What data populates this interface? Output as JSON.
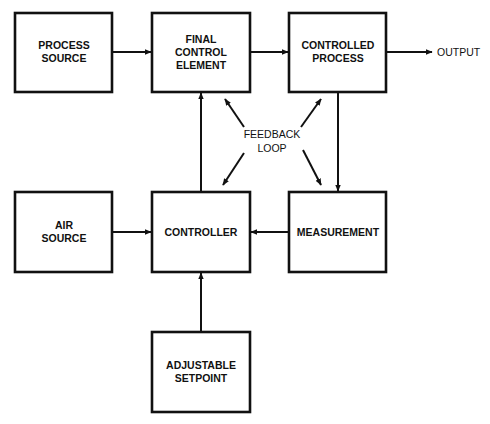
{
  "diagram": {
    "colors": {
      "stroke": "#111111",
      "background": "#ffffff"
    },
    "blocks": {
      "process_source": {
        "line1": "PROCESS",
        "line2": "SOURCE"
      },
      "final_control_element": {
        "line1": "FINAL",
        "line2": "CONTROL",
        "line3": "ELEMENT"
      },
      "controlled_process": {
        "line1": "CONTROLLED",
        "line2": "PROCESS"
      },
      "air_source": {
        "line1": "AIR",
        "line2": "SOURCE"
      },
      "controller": {
        "line1": "CONTROLLER"
      },
      "measurement": {
        "line1": "MEASUREMENT"
      },
      "adjustable_setpoint": {
        "line1": "ADJUSTABLE",
        "line2": "SETPOINT"
      }
    },
    "labels": {
      "output": "OUTPUT",
      "feedback_line1": "FEEDBACK",
      "feedback_line2": "LOOP"
    },
    "connections": [
      {
        "from": "PROCESS SOURCE",
        "to": "FINAL CONTROL ELEMENT"
      },
      {
        "from": "FINAL CONTROL ELEMENT",
        "to": "CONTROLLED PROCESS"
      },
      {
        "from": "CONTROLLED PROCESS",
        "to": "OUTPUT"
      },
      {
        "from": "CONTROLLED PROCESS",
        "to": "MEASUREMENT"
      },
      {
        "from": "MEASUREMENT",
        "to": "CONTROLLER"
      },
      {
        "from": "AIR SOURCE",
        "to": "CONTROLLER"
      },
      {
        "from": "ADJUSTABLE SETPOINT",
        "to": "CONTROLLER"
      },
      {
        "from": "CONTROLLER",
        "to": "FINAL CONTROL ELEMENT"
      }
    ]
  }
}
